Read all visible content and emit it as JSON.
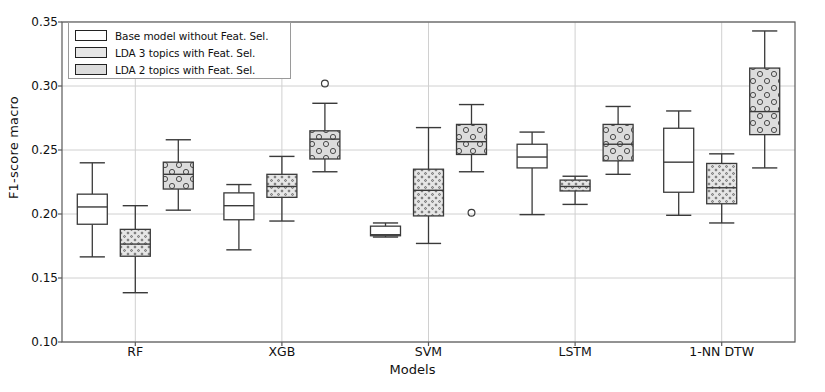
{
  "chart_data": {
    "type": "box",
    "title": "",
    "xlabel": "Models",
    "ylabel": "F1-score macro",
    "ylim": [
      0.1,
      0.35
    ],
    "yticks": [
      "0.10",
      "0.15",
      "0.20",
      "0.25",
      "0.30",
      "0.35"
    ],
    "ytick_values": [
      0.1,
      0.15,
      0.2,
      0.25,
      0.3,
      0.35
    ],
    "categories": [
      "RF",
      "XGB",
      "SVM",
      "LSTM",
      "1-NN DTW"
    ],
    "grid": true,
    "legend_position": "upper left",
    "series": [
      {
        "name": "Base model without Feat. Sel.",
        "fill": "#ffffff",
        "hatch": "none",
        "boxes": [
          {
            "category": "RF",
            "whisker_low": 0.1665,
            "q1": 0.192,
            "median": 0.2055,
            "q3": 0.2155,
            "whisker_high": 0.24,
            "outliers": []
          },
          {
            "category": "XGB",
            "whisker_low": 0.172,
            "q1": 0.1955,
            "median": 0.2065,
            "q3": 0.2165,
            "whisker_high": 0.223,
            "outliers": []
          },
          {
            "category": "SVM",
            "whisker_low": 0.182,
            "q1": 0.183,
            "median": 0.1838,
            "q3": 0.1905,
            "whisker_high": 0.193,
            "outliers": []
          },
          {
            "category": "LSTM",
            "whisker_low": 0.1995,
            "q1": 0.236,
            "median": 0.2445,
            "q3": 0.2545,
            "whisker_high": 0.264,
            "outliers": []
          },
          {
            "category": "1-NN DTW",
            "whisker_low": 0.199,
            "q1": 0.217,
            "median": 0.2405,
            "q3": 0.267,
            "whisker_high": 0.2805,
            "outliers": []
          }
        ]
      },
      {
        "name": "LDA 3 topics with Feat. Sel.",
        "fill": "#e3e3e3",
        "hatch": "dots-small",
        "boxes": [
          {
            "category": "RF",
            "whisker_low": 0.1385,
            "q1": 0.167,
            "median": 0.1765,
            "q3": 0.188,
            "whisker_high": 0.2065,
            "outliers": []
          },
          {
            "category": "XGB",
            "whisker_low": 0.1945,
            "q1": 0.213,
            "median": 0.2215,
            "q3": 0.231,
            "whisker_high": 0.245,
            "outliers": []
          },
          {
            "category": "SVM",
            "whisker_low": 0.177,
            "q1": 0.1985,
            "median": 0.2185,
            "q3": 0.235,
            "whisker_high": 0.2675,
            "outliers": []
          },
          {
            "category": "LSTM",
            "whisker_low": 0.2075,
            "q1": 0.218,
            "median": 0.2215,
            "q3": 0.2265,
            "whisker_high": 0.2295,
            "outliers": []
          },
          {
            "category": "1-NN DTW",
            "whisker_low": 0.193,
            "q1": 0.208,
            "median": 0.2205,
            "q3": 0.2395,
            "whisker_high": 0.247,
            "outliers": []
          }
        ]
      },
      {
        "name": "LDA 2 topics with Feat. Sel.",
        "fill": "#d9d9d9",
        "hatch": "circles",
        "boxes": [
          {
            "category": "RF",
            "whisker_low": 0.203,
            "q1": 0.2195,
            "median": 0.231,
            "q3": 0.2405,
            "whisker_high": 0.258,
            "outliers": []
          },
          {
            "category": "XGB",
            "whisker_low": 0.233,
            "q1": 0.243,
            "median": 0.2585,
            "q3": 0.265,
            "whisker_high": 0.2865,
            "outliers": [
              0.302
            ]
          },
          {
            "category": "SVM",
            "whisker_low": 0.233,
            "q1": 0.2465,
            "median": 0.2565,
            "q3": 0.27,
            "whisker_high": 0.2855,
            "outliers": [
              0.201
            ]
          },
          {
            "category": "LSTM",
            "whisker_low": 0.231,
            "q1": 0.2415,
            "median": 0.2545,
            "q3": 0.27,
            "whisker_high": 0.284,
            "outliers": []
          },
          {
            "category": "1-NN DTW",
            "whisker_low": 0.236,
            "q1": 0.262,
            "median": 0.28,
            "q3": 0.314,
            "whisker_high": 0.343,
            "outliers": []
          }
        ]
      }
    ]
  },
  "legend": {
    "items": [
      {
        "label": "Base model without Feat. Sel."
      },
      {
        "label": "LDA 3 topics with Feat. Sel."
      },
      {
        "label": "LDA 2 topics with Feat. Sel."
      }
    ]
  },
  "colors": {
    "line": "#3a3a3a",
    "grid": "#d0d0d0",
    "frame": "#5a5a5a",
    "text": "#111111"
  }
}
